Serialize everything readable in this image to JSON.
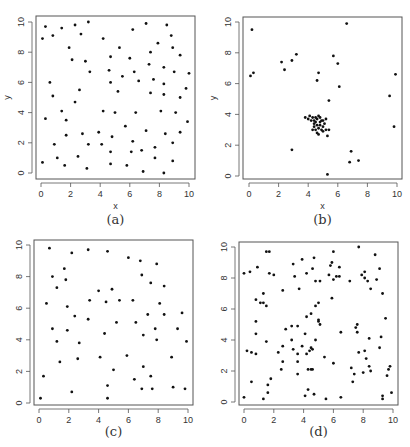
{
  "figure": {
    "panels": [
      {
        "id": "a",
        "caption": "(a)",
        "xlabel": "x",
        "ylabel": "y"
      },
      {
        "id": "b",
        "caption": "(b)",
        "xlabel": "x",
        "ylabel": "y"
      },
      {
        "id": "c",
        "caption": "(c)",
        "xlabel": "",
        "ylabel": ""
      },
      {
        "id": "d",
        "caption": "(d)",
        "xlabel": "",
        "ylabel": ""
      }
    ],
    "ticks": [
      "0",
      "2",
      "4",
      "6",
      "8",
      "10"
    ]
  },
  "chart_data": [
    {
      "type": "scatter",
      "title": "(a)",
      "xlabel": "x",
      "ylabel": "y",
      "xlim": [
        0,
        10
      ],
      "ylim": [
        0,
        10
      ],
      "xticks": [
        0,
        2,
        4,
        6,
        8,
        10
      ],
      "yticks": [
        0,
        2,
        4,
        6,
        8,
        10
      ],
      "grid": false,
      "points": [
        [
          0.1,
          8.9
        ],
        [
          0.3,
          9.7
        ],
        [
          0.8,
          9.1
        ],
        [
          1.4,
          9.6
        ],
        [
          2.3,
          9.8
        ],
        [
          3.2,
          10.0
        ],
        [
          2.7,
          9.2
        ],
        [
          1.9,
          8.3
        ],
        [
          2.1,
          7.5
        ],
        [
          3.0,
          7.4
        ],
        [
          3.3,
          6.7
        ],
        [
          4.2,
          8.9
        ],
        [
          5.3,
          8.3
        ],
        [
          4.7,
          7.7
        ],
        [
          4.6,
          6.8
        ],
        [
          4.7,
          6.0
        ],
        [
          5.5,
          6.4
        ],
        [
          6.0,
          7.6
        ],
        [
          6.2,
          9.5
        ],
        [
          6.3,
          6.7
        ],
        [
          6.6,
          6.1
        ],
        [
          7.1,
          9.9
        ],
        [
          7.4,
          8.0
        ],
        [
          7.3,
          7.2
        ],
        [
          7.6,
          6.2
        ],
        [
          7.9,
          8.6
        ],
        [
          8.3,
          7.0
        ],
        [
          8.3,
          5.9
        ],
        [
          8.5,
          9.8
        ],
        [
          8.8,
          9.1
        ],
        [
          8.9,
          8.3
        ],
        [
          9.0,
          6.7
        ],
        [
          9.4,
          7.8
        ],
        [
          10.0,
          6.6
        ],
        [
          9.8,
          5.6
        ],
        [
          9.4,
          5.0
        ],
        [
          8.3,
          5.2
        ],
        [
          7.4,
          5.3
        ],
        [
          5.2,
          5.4
        ],
        [
          0.6,
          6.0
        ],
        [
          0.8,
          5.1
        ],
        [
          2.6,
          5.5
        ],
        [
          2.3,
          4.7
        ],
        [
          1.4,
          4.1
        ],
        [
          0.3,
          3.6
        ],
        [
          1.7,
          3.5
        ],
        [
          4.2,
          4.1
        ],
        [
          5.0,
          4.0
        ],
        [
          6.4,
          4.0
        ],
        [
          8.1,
          4.1
        ],
        [
          9.1,
          4.0
        ],
        [
          9.9,
          3.4
        ],
        [
          5.7,
          3.1
        ],
        [
          1.7,
          2.5
        ],
        [
          2.8,
          2.6
        ],
        [
          3.9,
          2.7
        ],
        [
          4.8,
          2.4
        ],
        [
          7.1,
          2.8
        ],
        [
          8.4,
          2.6
        ],
        [
          9.4,
          2.7
        ],
        [
          0.9,
          1.9
        ],
        [
          3.2,
          1.9
        ],
        [
          4.1,
          1.9
        ],
        [
          6.2,
          2.1
        ],
        [
          7.7,
          1.7
        ],
        [
          8.9,
          2.0
        ],
        [
          1.1,
          1.0
        ],
        [
          2.5,
          1.1
        ],
        [
          4.7,
          1.4
        ],
        [
          6.1,
          1.4
        ],
        [
          6.8,
          1.5
        ],
        [
          7.7,
          1.0
        ],
        [
          8.9,
          0.8
        ],
        [
          0.1,
          0.7
        ],
        [
          1.6,
          0.5
        ],
        [
          3.1,
          0.3
        ],
        [
          4.7,
          0.6
        ],
        [
          5.8,
          0.5
        ],
        [
          6.9,
          0.1
        ],
        [
          8.3,
          0.0
        ]
      ]
    },
    {
      "type": "scatter",
      "title": "(b)",
      "xlabel": "x",
      "ylabel": "y",
      "xlim": [
        0,
        10
      ],
      "ylim": [
        0,
        10
      ],
      "xticks": [
        0,
        2,
        4,
        6,
        8,
        10
      ],
      "yticks": [
        0,
        2,
        4,
        6,
        8,
        10
      ],
      "grid": false,
      "points": [
        [
          0.2,
          9.5
        ],
        [
          6.6,
          9.9
        ],
        [
          0.1,
          6.5
        ],
        [
          0.3,
          6.7
        ],
        [
          2.2,
          7.4
        ],
        [
          2.4,
          6.9
        ],
        [
          2.9,
          7.5
        ],
        [
          3.2,
          7.9
        ],
        [
          5.7,
          7.8
        ],
        [
          6.0,
          7.3
        ],
        [
          4.7,
          6.7
        ],
        [
          4.6,
          6.2
        ],
        [
          6.1,
          5.8
        ],
        [
          5.4,
          4.9
        ],
        [
          9.5,
          5.2
        ],
        [
          9.9,
          6.6
        ],
        [
          9.8,
          3.2
        ],
        [
          2.9,
          1.7
        ],
        [
          6.9,
          1.6
        ],
        [
          6.8,
          0.9
        ],
        [
          7.4,
          1.0
        ],
        [
          5.3,
          0.1
        ],
        [
          3.8,
          3.8
        ],
        [
          4.0,
          3.7
        ],
        [
          4.1,
          3.9
        ],
        [
          4.2,
          3.6
        ],
        [
          4.3,
          3.8
        ],
        [
          4.4,
          3.4
        ],
        [
          4.4,
          3.2
        ],
        [
          4.5,
          3.0
        ],
        [
          4.5,
          3.5
        ],
        [
          4.6,
          3.7
        ],
        [
          4.6,
          3.3
        ],
        [
          4.7,
          3.9
        ],
        [
          4.7,
          3.1
        ],
        [
          4.8,
          3.5
        ],
        [
          4.8,
          3.3
        ],
        [
          4.9,
          3.6
        ],
        [
          4.9,
          3.0
        ],
        [
          5.0,
          3.2
        ],
        [
          5.0,
          2.9
        ],
        [
          5.1,
          3.4
        ],
        [
          5.2,
          3.7
        ],
        [
          5.2,
          3.0
        ],
        [
          5.3,
          2.6
        ],
        [
          4.6,
          2.8
        ],
        [
          4.7,
          2.7
        ],
        [
          4.3,
          3.0
        ],
        [
          4.5,
          3.8
        ],
        [
          4.8,
          3.8
        ],
        [
          5.0,
          3.6
        ],
        [
          4.4,
          3.6
        ],
        [
          5.4,
          3.0
        ]
      ]
    },
    {
      "type": "scatter",
      "title": "(c)",
      "xlabel": "",
      "ylabel": "",
      "xlim": [
        0,
        10
      ],
      "ylim": [
        0,
        10
      ],
      "xticks": [
        0,
        2,
        4,
        6,
        8,
        10
      ],
      "yticks": [
        0,
        2,
        4,
        6,
        8,
        10
      ],
      "grid": false,
      "points": [
        [
          0.7,
          9.8
        ],
        [
          2.2,
          9.5
        ],
        [
          3.3,
          9.7
        ],
        [
          4.6,
          9.6
        ],
        [
          6.0,
          9.2
        ],
        [
          6.8,
          9.0
        ],
        [
          7.9,
          8.8
        ],
        [
          1.7,
          8.5
        ],
        [
          0.9,
          8.0
        ],
        [
          1.8,
          7.8
        ],
        [
          6.9,
          8.1
        ],
        [
          1.2,
          7.3
        ],
        [
          4.0,
          7.1
        ],
        [
          4.9,
          7.2
        ],
        [
          7.5,
          7.6
        ],
        [
          8.4,
          7.4
        ],
        [
          0.5,
          6.3
        ],
        [
          3.4,
          6.5
        ],
        [
          4.5,
          6.4
        ],
        [
          5.4,
          6.5
        ],
        [
          6.3,
          6.5
        ],
        [
          8.1,
          6.3
        ],
        [
          1.9,
          6.1
        ],
        [
          2.4,
          5.5
        ],
        [
          3.3,
          5.3
        ],
        [
          5.2,
          5.1
        ],
        [
          6.5,
          5.1
        ],
        [
          7.3,
          5.6
        ],
        [
          8.4,
          5.6
        ],
        [
          9.6,
          5.7
        ],
        [
          0.9,
          4.7
        ],
        [
          1.9,
          4.6
        ],
        [
          4.4,
          4.4
        ],
        [
          7.0,
          4.3
        ],
        [
          7.8,
          4.7
        ],
        [
          9.3,
          4.7
        ],
        [
          1.2,
          3.9
        ],
        [
          2.7,
          3.8
        ],
        [
          7.9,
          4.0
        ],
        [
          9.9,
          3.9
        ],
        [
          1.4,
          2.6
        ],
        [
          2.6,
          2.8
        ],
        [
          4.1,
          2.9
        ],
        [
          5.9,
          3.0
        ],
        [
          8.9,
          2.9
        ],
        [
          5.0,
          2.1
        ],
        [
          7.0,
          2.3
        ],
        [
          0.3,
          1.7
        ],
        [
          6.4,
          1.5
        ],
        [
          7.5,
          1.7
        ],
        [
          4.6,
          1.1
        ],
        [
          6.9,
          0.9
        ],
        [
          7.6,
          0.9
        ],
        [
          9.0,
          1.0
        ],
        [
          9.8,
          0.9
        ],
        [
          2.2,
          0.7
        ],
        [
          0.1,
          0.3
        ],
        [
          4.6,
          0.3
        ]
      ]
    },
    {
      "type": "scatter",
      "title": "(d)",
      "xlabel": "",
      "ylabel": "",
      "xlim": [
        0,
        10
      ],
      "ylim": [
        0,
        10
      ],
      "xticks": [
        0,
        2,
        4,
        6,
        8,
        10
      ],
      "yticks": [
        0,
        2,
        4,
        6,
        8,
        10
      ],
      "grid": false,
      "points": [
        [
          1.5,
          9.7
        ],
        [
          1.7,
          9.7
        ],
        [
          7.7,
          10.0
        ],
        [
          6.0,
          9.7
        ],
        [
          8.8,
          9.5
        ],
        [
          3.9,
          9.2
        ],
        [
          4.7,
          9.3
        ],
        [
          5.9,
          9.0
        ],
        [
          3.3,
          8.9
        ],
        [
          5.8,
          8.8
        ],
        [
          0.9,
          8.7
        ],
        [
          4.6,
          8.6
        ],
        [
          6.4,
          8.7
        ],
        [
          9.1,
          8.6
        ],
        [
          0.4,
          8.4
        ],
        [
          0.0,
          8.3
        ],
        [
          1.7,
          8.3
        ],
        [
          2.0,
          8.2
        ],
        [
          3.4,
          8.1
        ],
        [
          4.2,
          8.3
        ],
        [
          5.7,
          8.2
        ],
        [
          6.2,
          8.1
        ],
        [
          6.4,
          8.1
        ],
        [
          6.0,
          7.9
        ],
        [
          7.9,
          8.2
        ],
        [
          8.1,
          8.4
        ],
        [
          8.1,
          8.0
        ],
        [
          8.3,
          7.8
        ],
        [
          8.9,
          7.9
        ],
        [
          4.8,
          7.8
        ],
        [
          5.1,
          7.8
        ],
        [
          7.1,
          7.8
        ],
        [
          3.7,
          7.3
        ],
        [
          2.6,
          7.2
        ],
        [
          8.5,
          7.3
        ],
        [
          9.3,
          7.0
        ],
        [
          1.3,
          7.0
        ],
        [
          0.8,
          6.6
        ],
        [
          1.1,
          6.4
        ],
        [
          1.3,
          6.4
        ],
        [
          1.5,
          6.2
        ],
        [
          5.9,
          6.7
        ],
        [
          4.8,
          6.2
        ],
        [
          5.0,
          6.4
        ],
        [
          4.2,
          5.5
        ],
        [
          4.5,
          5.7
        ],
        [
          5.0,
          5.3
        ],
        [
          5.0,
          5.2
        ],
        [
          5.1,
          5.0
        ],
        [
          9.5,
          5.4
        ],
        [
          0.8,
          5.2
        ],
        [
          3.2,
          4.9
        ],
        [
          3.6,
          4.9
        ],
        [
          2.8,
          4.7
        ],
        [
          7.5,
          4.8
        ],
        [
          7.6,
          5.0
        ],
        [
          7.6,
          4.5
        ],
        [
          6.5,
          4.5
        ],
        [
          4.1,
          4.4
        ],
        [
          0.8,
          4.4
        ],
        [
          3.2,
          4.0
        ],
        [
          4.8,
          4.0
        ],
        [
          8.4,
          4.1
        ],
        [
          9.2,
          4.2
        ],
        [
          1.5,
          3.9
        ],
        [
          2.6,
          3.6
        ],
        [
          3.9,
          3.6
        ],
        [
          4.5,
          3.5
        ],
        [
          4.6,
          3.4
        ],
        [
          3.3,
          3.4
        ],
        [
          9.1,
          3.5
        ],
        [
          0.2,
          3.3
        ],
        [
          0.5,
          3.2
        ],
        [
          2.3,
          3.2
        ],
        [
          4.4,
          3.3
        ],
        [
          8.1,
          3.3
        ],
        [
          7.7,
          3.2
        ],
        [
          0.8,
          3.1
        ],
        [
          3.6,
          3.1
        ],
        [
          4.2,
          3.1
        ],
        [
          5.4,
          2.9
        ],
        [
          8.2,
          2.8
        ],
        [
          2.6,
          2.6
        ],
        [
          3.6,
          2.6
        ],
        [
          6.0,
          2.5
        ],
        [
          7.2,
          2.2
        ],
        [
          8.4,
          2.3
        ],
        [
          8.5,
          2.0
        ],
        [
          9.8,
          2.3
        ],
        [
          9.7,
          2.1
        ],
        [
          2.5,
          2.1
        ],
        [
          4.3,
          2.1
        ],
        [
          4.5,
          2.1
        ],
        [
          4.6,
          2.1
        ],
        [
          8.0,
          1.9
        ],
        [
          3.6,
          1.8
        ],
        [
          7.4,
          1.8
        ],
        [
          9.6,
          1.7
        ],
        [
          1.8,
          1.5
        ],
        [
          0.5,
          1.3
        ],
        [
          7.3,
          1.3
        ],
        [
          1.6,
          1.1
        ],
        [
          4.3,
          0.8
        ],
        [
          1.6,
          0.6
        ],
        [
          9.9,
          0.6
        ],
        [
          4.7,
          0.5
        ],
        [
          4.1,
          0.4
        ],
        [
          9.3,
          0.4
        ],
        [
          9.3,
          0.2
        ],
        [
          0.0,
          0.3
        ],
        [
          1.3,
          0.2
        ],
        [
          5.5,
          0.2
        ],
        [
          6.5,
          0.3
        ]
      ]
    }
  ]
}
